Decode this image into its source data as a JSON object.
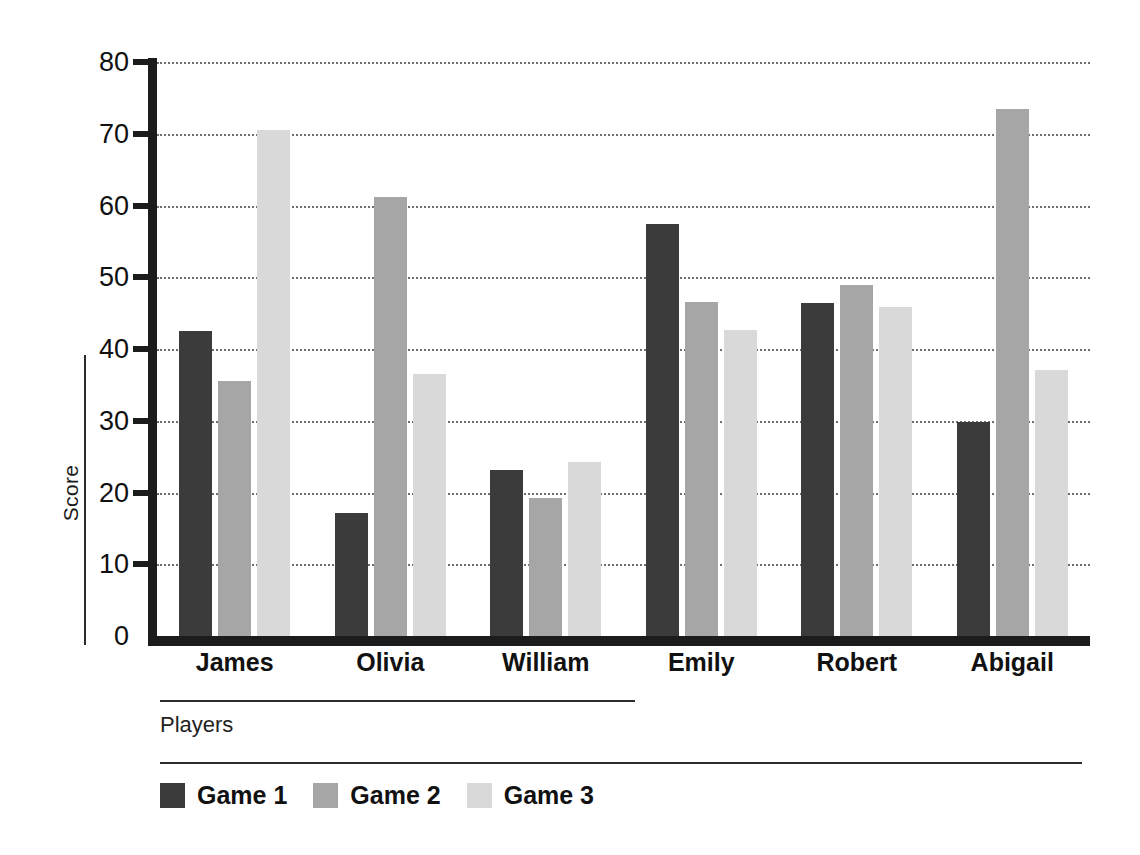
{
  "chart_data": {
    "type": "bar",
    "title": "",
    "xlabel": "Players",
    "ylabel": "Score",
    "categories": [
      "James",
      "Olivia",
      "William",
      "Emily",
      "Robert",
      "Abigail"
    ],
    "series": [
      {
        "name": "Game 1",
        "color": "#3b3b3b",
        "values": [
          42.5,
          17.2,
          23.1,
          57.4,
          46.4,
          29.8
        ]
      },
      {
        "name": "Game 2",
        "color": "#a6a6a6",
        "values": [
          35.5,
          61.2,
          19.2,
          46.6,
          48.9,
          73.5
        ]
      },
      {
        "name": "Game 3",
        "color": "#d9d9d9",
        "values": [
          70.5,
          36.5,
          24.2,
          42.7,
          45.9,
          37.1
        ]
      }
    ],
    "ylim": [
      0,
      80
    ],
    "yticks": [
      0,
      10,
      20,
      30,
      40,
      50,
      60,
      70,
      80
    ],
    "ytick_labels": [
      "0",
      "10",
      "20",
      "30",
      "40",
      "50",
      "60",
      "70",
      "80"
    ],
    "grid": true,
    "grid_style": "dotted",
    "legend_position": "bottom-left",
    "axis_color": "#1c1c1c",
    "background": "#ffffff"
  },
  "legend": {
    "entries": [
      {
        "label": "Game 1",
        "color": "#3b3b3b"
      },
      {
        "label": "Game 2",
        "color": "#a6a6a6"
      },
      {
        "label": "Game 3",
        "color": "#d9d9d9"
      }
    ]
  }
}
